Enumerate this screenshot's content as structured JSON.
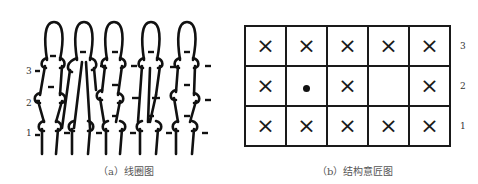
{
  "panel_a": {
    "caption": "（a）线圈图",
    "row_labels": [
      "3",
      "2",
      "1"
    ],
    "wales": 5,
    "courses": 3
  },
  "panel_b": {
    "caption": "（b）结构意匠图",
    "row_labels": [
      "3",
      "2",
      "1"
    ],
    "legend": {
      "x": "×",
      "dot": "•",
      "empty": ""
    },
    "grid": [
      [
        "x",
        "x",
        "x",
        "x",
        "x"
      ],
      [
        "x",
        "dot",
        "x",
        "empty",
        "x"
      ],
      [
        "x",
        "x",
        "x",
        "x",
        "x"
      ]
    ]
  }
}
